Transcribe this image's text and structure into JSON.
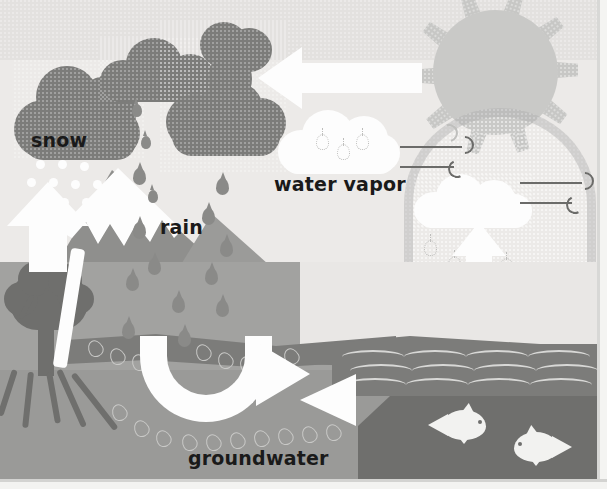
{
  "diagram": {
    "labels": {
      "snow": "snow",
      "rain": "rain",
      "water_vapor": "water vapor",
      "groundwater": "groundwater"
    },
    "palette": {
      "sky": "#eceae8",
      "sky_band": "#e3e1df",
      "sun": "#c9c9c7",
      "sun_ray": "#c7c7c5",
      "dark_cloud": "#7c7c7a",
      "white_cloud": "#fdfdfd",
      "rain_drop": "#8a8a88",
      "mountain": "#8f8f8d",
      "mountain_light": "#9b9b99",
      "ground": "#a2a2a0",
      "subsoil": "#9a9a98",
      "aquifer": "#7c7c7a",
      "water": "#7c7c7a",
      "water_deep": "#6f6f6d",
      "tree": "#6f6f6d",
      "arrow": "#fdfdfd",
      "label_text": "#1a1a1a",
      "wind": "#6b6b69"
    },
    "elements": {
      "sun": "sun-icon",
      "sun_rays_count": 10,
      "dark_clouds_count": 3,
      "white_clouds_count": 2,
      "rain_drops_count": 12,
      "snowflakes_count": 11,
      "fish_count": 2,
      "tree_count": 1,
      "arrows": [
        "condensation-arrow-left",
        "snow-arrow-up",
        "evaporation-arrow-up",
        "runoff-arrow-curved",
        "infiltration-arrow-left"
      ],
      "wind_swirl_sets": 3,
      "groundwater_droplet_trails": 3
    },
    "processes": [
      "snow",
      "rain",
      "water vapor",
      "groundwater"
    ]
  }
}
